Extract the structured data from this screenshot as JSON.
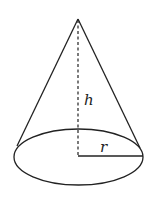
{
  "diagram": {
    "labels": {
      "height": "h",
      "radius": "r"
    },
    "colors": {
      "stroke": "#222222",
      "background": "#ffffff"
    }
  }
}
